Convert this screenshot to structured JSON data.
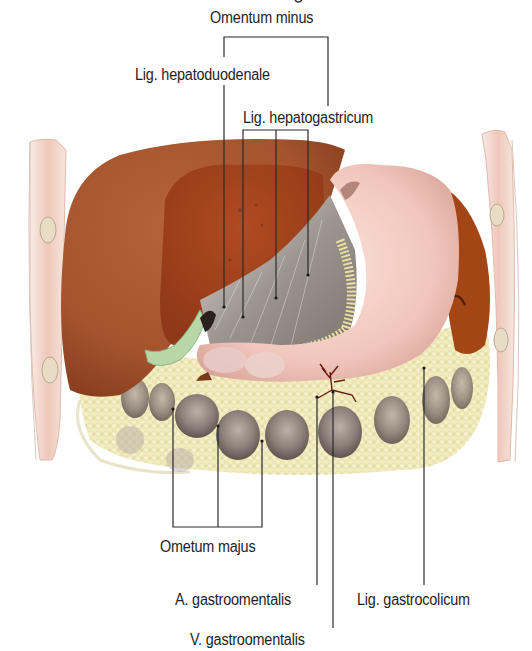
{
  "figure": {
    "type": "anatomical illustration",
    "colors": {
      "liver": "#a8522a",
      "liver_dark": "#8e3a1a",
      "stomach": "#f2c9c0",
      "omentum_fat": "#efe9b8",
      "lesser_omentum": "#9a938c",
      "gallbladder": "#b9d9a8",
      "body_wall": "#f1cfc4",
      "leader_line": "#2a2a2a",
      "text": "#1e1e1e"
    }
  },
  "labels": {
    "omentum_minus": "Omentum minus",
    "lig_hepatoduodenale": "Lig. hepatoduodenale",
    "lig_hepatogastricum": "Lig. hepatogastricum",
    "omentum_majus": "Ometum majus",
    "a_gastroomentalis": "A. gastroomentalis",
    "lig_gastrocolicum": "Lig. gastrocolicum",
    "v_gastroomentalis": "V. gastroomentalis"
  }
}
